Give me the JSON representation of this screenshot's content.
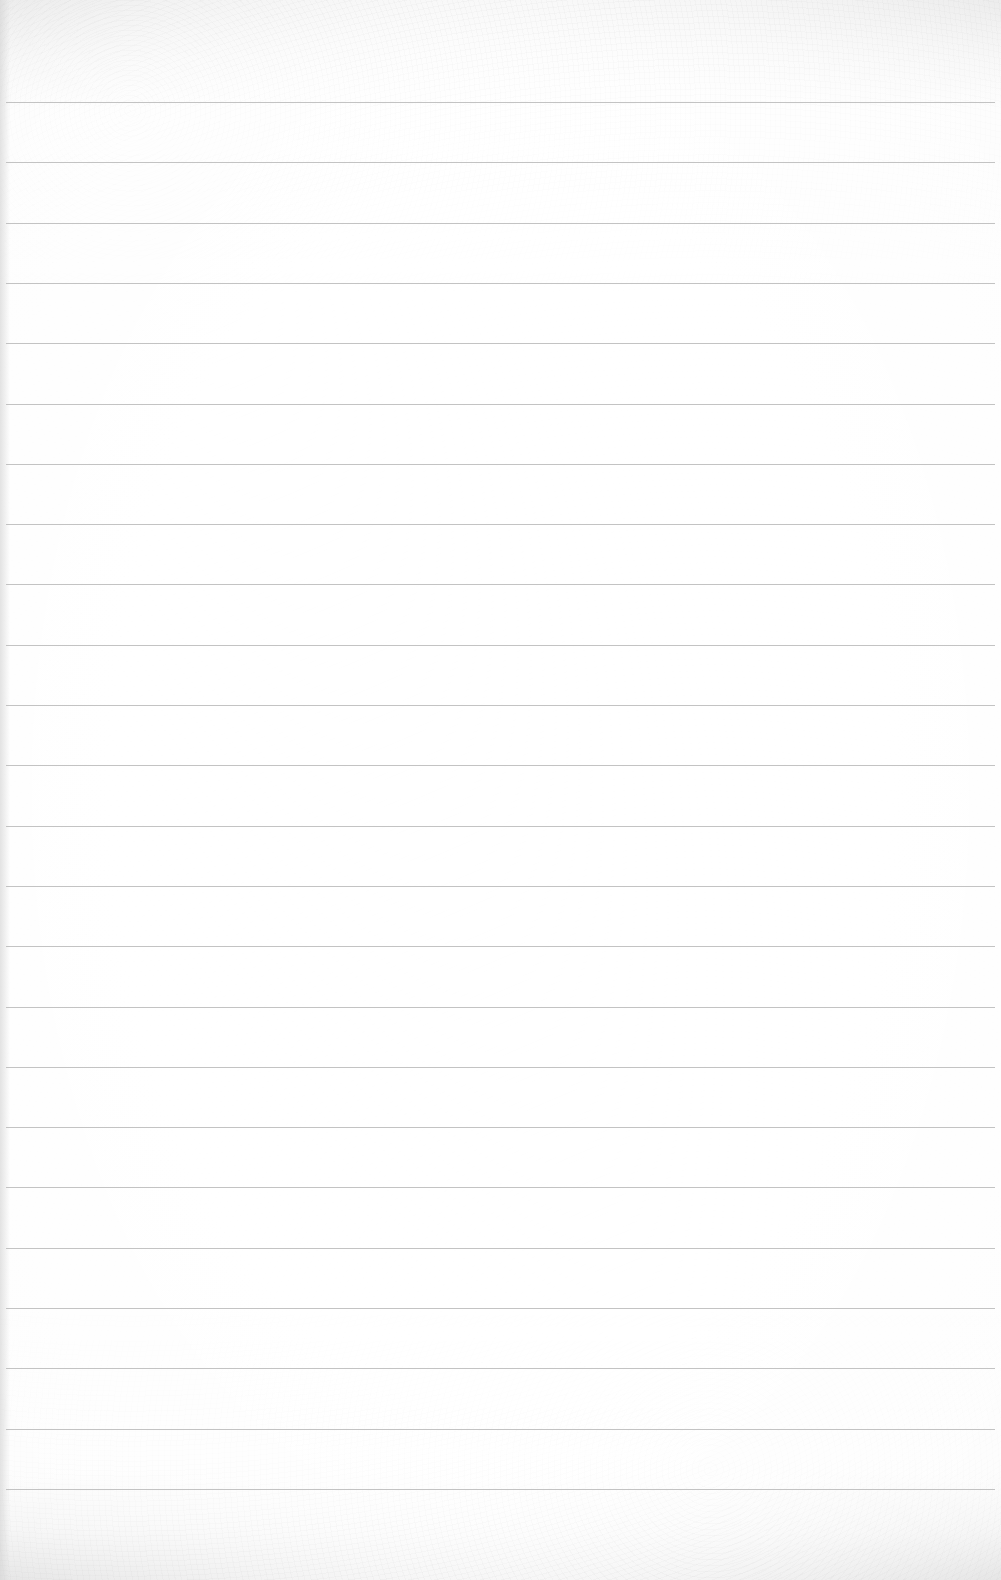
{
  "page": {
    "type": "blank lined paper",
    "text": "",
    "line_count": 24,
    "line_start_y": 102,
    "line_spacing": 60.3,
    "line_color": "#b9b9b9",
    "paper_color": "#fdfdfd"
  }
}
